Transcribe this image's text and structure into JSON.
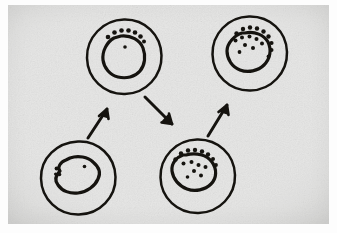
{
  "figure": {
    "title": "Hand-drawn cell sequence diagram",
    "description": "Four hand-drawn circular cells, each containing an irregular nucleus blob, linked by three hand-drawn arrows in a zig-zag progression from lower left to upper right.",
    "medium": "ink on paper photograph",
    "background_color": "#e7e7e6",
    "ink_color": "#15130f",
    "scan_margin_color": "#fdfdfd"
  },
  "cells": [
    {
      "id": "cell-lower-left",
      "name": "cell-lower-left",
      "label": "",
      "stage_index": 1,
      "position": {
        "cx": 78,
        "cy": 180
      },
      "membrane_radius": 37,
      "nucleus": {
        "shape": "smooth irregular blob",
        "spikes": 0,
        "granule_dots": 4,
        "dot_positions": "three small dots clustered on the left margin, one dot inside upper right"
      }
    },
    {
      "id": "cell-upper-middle",
      "name": "cell-upper-middle",
      "label": "",
      "stage_index": 2,
      "position": {
        "cx": 123,
        "cy": 57
      },
      "membrane_radius": 37,
      "nucleus": {
        "shape": "irregular blob with crown",
        "spikes": 7,
        "granule_dots": 1,
        "dot_positions": "arc of seven dark granules across the top of the nucleus, one dot inside centre"
      }
    },
    {
      "id": "cell-lower-right",
      "name": "cell-lower-right",
      "label": "",
      "stage_index": 3,
      "position": {
        "cx": 197,
        "cy": 178
      },
      "membrane_radius": 37,
      "nucleus": {
        "shape": "irregular blob with spiky upper rim",
        "spikes": 8,
        "granule_dots": 7,
        "dot_positions": "spiky projections along the upper-left rim with several dark granules inside"
      }
    },
    {
      "id": "cell-upper-right",
      "name": "cell-upper-right",
      "label": "",
      "stage_index": 4,
      "position": {
        "cx": 249,
        "cy": 54
      },
      "membrane_radius": 37,
      "nucleus": {
        "shape": "irregular blob with spiky upper-right rim",
        "spikes": 9,
        "granule_dots": 8,
        "dot_positions": "dense spikes and granules along the upper-right rim of the nucleus"
      }
    }
  ],
  "arrows": [
    {
      "id": "arrow-1",
      "name": "arrow-lower-left-to-upper-middle",
      "from": "cell-lower-left",
      "to": "cell-upper-middle",
      "direction": "up-right",
      "label": "",
      "start": {
        "x": 89,
        "y": 138
      },
      "end": {
        "x": 106,
        "y": 109
      }
    },
    {
      "id": "arrow-2",
      "name": "arrow-upper-middle-to-lower-right",
      "from": "cell-upper-middle",
      "to": "cell-lower-right",
      "direction": "down-right",
      "label": "",
      "start": {
        "x": 145,
        "y": 97
      },
      "end": {
        "x": 170,
        "y": 124
      }
    },
    {
      "id": "arrow-3",
      "name": "arrow-lower-right-to-upper-right",
      "from": "cell-lower-right",
      "to": "cell-upper-right",
      "direction": "up-right",
      "label": "",
      "start": {
        "x": 210,
        "y": 136
      },
      "end": {
        "x": 226,
        "y": 105
      }
    }
  ]
}
